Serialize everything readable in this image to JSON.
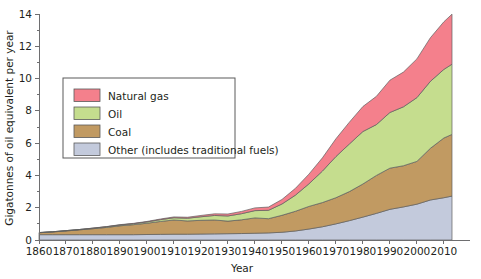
{
  "chart_data": {
    "type": "area",
    "stacked": true,
    "title": "",
    "subtitle": "",
    "xlabel": "Year",
    "ylabel": "Gigatonnes of oil equivalent per year",
    "xlim": [
      1860,
      2013
    ],
    "ylim": [
      0,
      14
    ],
    "xticks": [
      1860,
      1870,
      1880,
      1890,
      1900,
      1910,
      1920,
      1930,
      1940,
      1950,
      1960,
      1970,
      1980,
      1990,
      2000,
      2010
    ],
    "yticks": [
      0,
      2,
      4,
      6,
      8,
      10,
      12,
      14
    ],
    "y_minor_ticks": [
      1,
      3,
      5,
      7,
      9,
      11,
      13
    ],
    "grid": false,
    "legend_position": "upper-left-inside",
    "stack_order_bottom_to_top": [
      "Other (includes traditional fuels)",
      "Coal",
      "Oil",
      "Natural gas"
    ],
    "x": [
      1860,
      1865,
      1870,
      1875,
      1880,
      1885,
      1890,
      1895,
      1900,
      1905,
      1910,
      1915,
      1920,
      1925,
      1930,
      1935,
      1940,
      1945,
      1950,
      1955,
      1960,
      1965,
      1970,
      1975,
      1980,
      1985,
      1990,
      1995,
      2000,
      2005,
      2010,
      2013
    ],
    "series": [
      {
        "name": "Other (includes traditional fuels)",
        "color": "#c3cadc",
        "values": [
          0.33,
          0.33,
          0.33,
          0.33,
          0.33,
          0.33,
          0.33,
          0.33,
          0.34,
          0.35,
          0.36,
          0.36,
          0.37,
          0.38,
          0.39,
          0.4,
          0.42,
          0.44,
          0.48,
          0.56,
          0.68,
          0.82,
          1.0,
          1.2,
          1.42,
          1.65,
          1.9,
          2.05,
          2.22,
          2.48,
          2.62,
          2.72
        ]
      },
      {
        "name": "Coal",
        "color": "#c19a62",
        "values": [
          0.12,
          0.17,
          0.23,
          0.3,
          0.37,
          0.45,
          0.55,
          0.62,
          0.7,
          0.8,
          0.88,
          0.82,
          0.85,
          0.86,
          0.78,
          0.85,
          0.95,
          0.88,
          1.05,
          1.22,
          1.4,
          1.5,
          1.62,
          1.8,
          2.05,
          2.35,
          2.55,
          2.55,
          2.65,
          3.2,
          3.7,
          3.82
        ]
      },
      {
        "name": "Oil",
        "color": "#c5dd8e",
        "values": [
          0.01,
          0.01,
          0.02,
          0.02,
          0.03,
          0.04,
          0.05,
          0.06,
          0.08,
          0.11,
          0.14,
          0.17,
          0.22,
          0.28,
          0.32,
          0.38,
          0.45,
          0.52,
          0.7,
          1.0,
          1.4,
          1.95,
          2.55,
          2.95,
          3.25,
          3.15,
          3.45,
          3.65,
          3.95,
          4.15,
          4.25,
          4.35
        ]
      },
      {
        "name": "Natural gas",
        "color": "#f4808c",
        "values": [
          0.0,
          0.0,
          0.0,
          0.0,
          0.01,
          0.01,
          0.02,
          0.02,
          0.03,
          0.04,
          0.05,
          0.06,
          0.08,
          0.1,
          0.12,
          0.14,
          0.17,
          0.2,
          0.28,
          0.42,
          0.6,
          0.82,
          1.1,
          1.35,
          1.55,
          1.75,
          2.0,
          2.15,
          2.4,
          2.7,
          2.95,
          3.1
        ]
      }
    ]
  },
  "legend": {
    "entries": [
      {
        "label": "Natural gas",
        "color": "#f4808c"
      },
      {
        "label": "Oil",
        "color": "#c5dd8e"
      },
      {
        "label": "Coal",
        "color": "#c19a62"
      },
      {
        "label": "Other (includes traditional fuels)",
        "color": "#c3cadc"
      }
    ]
  },
  "axes": {
    "x_title": "Year",
    "y_title": "Gigatonnes of oil equivalent per year",
    "x_tick_labels": [
      "1860",
      "1870",
      "1880",
      "1890",
      "1900",
      "1910",
      "1920",
      "1930",
      "1940",
      "1950",
      "1960",
      "1970",
      "1980",
      "1990",
      "2000",
      "2010"
    ],
    "y_tick_labels": [
      "0",
      "2",
      "4",
      "6",
      "8",
      "10",
      "12",
      "14"
    ]
  },
  "colors": {
    "natural_gas": "#f4808c",
    "oil": "#c5dd8e",
    "coal": "#c19a62",
    "other": "#c3cadc",
    "axis": "#6e6e70",
    "text": "#231f20",
    "outline": "#5f5f5f"
  }
}
